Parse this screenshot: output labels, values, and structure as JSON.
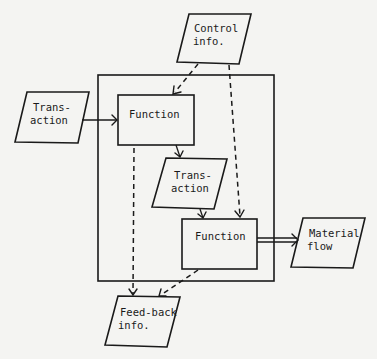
{
  "diagram": {
    "type": "flowchart",
    "nodes": {
      "control_info": {
        "shape": "parallelogram",
        "line1": "Control",
        "line2": "info."
      },
      "transaction_in": {
        "shape": "parallelogram",
        "line1": "Trans-",
        "line2": "action"
      },
      "function_1": {
        "shape": "rectangle",
        "line1": "Function"
      },
      "transaction_mid": {
        "shape": "parallelogram",
        "line1": "Trans-",
        "line2": "action"
      },
      "function_2": {
        "shape": "rectangle",
        "line1": "Function"
      },
      "material_flow": {
        "shape": "parallelogram",
        "line1": "Material",
        "line2": "flow"
      },
      "feedback_info": {
        "shape": "parallelogram",
        "line1": "Feed-back",
        "line2": "info."
      }
    },
    "containers": [
      {
        "id": "system_boundary",
        "shape": "rectangle",
        "contains": [
          "function_1",
          "transaction_mid",
          "function_2"
        ]
      }
    ],
    "edges": [
      {
        "from": "transaction_in",
        "to": "function_1",
        "style": "solid"
      },
      {
        "from": "control_info",
        "to": "function_1",
        "style": "dashed"
      },
      {
        "from": "control_info",
        "to": "function_2",
        "style": "dashed"
      },
      {
        "from": "function_1",
        "to": "transaction_mid",
        "style": "solid"
      },
      {
        "from": "transaction_mid",
        "to": "function_2",
        "style": "solid"
      },
      {
        "from": "function_2",
        "to": "material_flow",
        "style": "double"
      },
      {
        "from": "function_1",
        "to": "feedback_info",
        "style": "dashed"
      },
      {
        "from": "function_2",
        "to": "feedback_info",
        "style": "dashed"
      }
    ]
  }
}
